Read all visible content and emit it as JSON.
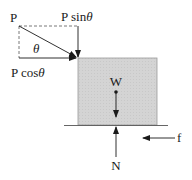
{
  "diagram": {
    "type": "free-body diagram",
    "labels": {
      "force_p": "P",
      "p_sin_prefix": "P sin",
      "p_cos_prefix": "P cos",
      "theta": "θ",
      "weight": "W",
      "normal": "N",
      "friction": "f"
    },
    "colors": {
      "block_fill": "#d4d4d4",
      "line": "#1a1a1a",
      "dashed": "#555555"
    }
  }
}
